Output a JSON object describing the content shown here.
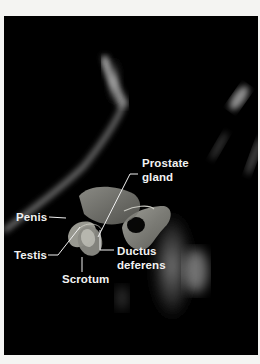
{
  "figure": {
    "background_color": "#000000",
    "page_color": "#f4f4f2",
    "label_color": "#f2f2f2",
    "labels": {
      "prostate_line1": "Prostate",
      "prostate_line2": "gland",
      "penis": "Penis",
      "testis": "Testis",
      "scrotum": "Scrotum",
      "ductus_line1": "Ductus",
      "ductus_line2": "deferens"
    }
  }
}
